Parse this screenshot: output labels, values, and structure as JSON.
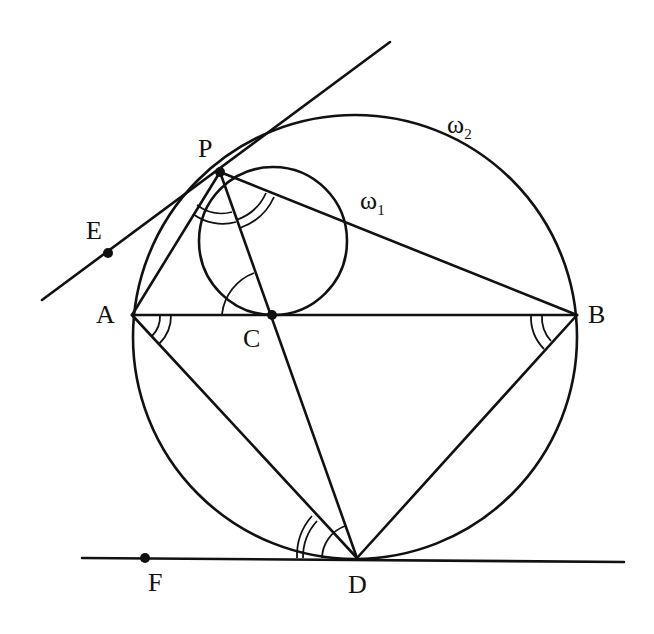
{
  "diagram": {
    "type": "geometry",
    "stroke_color": "#111111",
    "points": {
      "P": {
        "label": "P",
        "x": 220,
        "y": 172
      },
      "A": {
        "label": "A",
        "x": 132,
        "y": 315
      },
      "B": {
        "label": "B",
        "x": 577,
        "y": 315
      },
      "C": {
        "label": "C",
        "x": 272,
        "y": 315
      },
      "D": {
        "label": "D",
        "x": 357,
        "y": 558
      },
      "E": {
        "label": "E",
        "x": 108,
        "y": 253
      },
      "F": {
        "label": "F",
        "x": 145,
        "y": 558
      }
    },
    "circles": [
      {
        "name": "ω1",
        "label": "ω",
        "subscript": "1",
        "cx": 273,
        "cy": 241,
        "r": 74
      },
      {
        "name": "ω2",
        "label": "ω",
        "subscript": "2",
        "cx": 355,
        "cy": 337,
        "r": 222
      }
    ],
    "lines": [
      {
        "name": "tangent-PE",
        "from": [
          42,
          300
        ],
        "to": [
          390,
          42
        ]
      },
      {
        "name": "tangent-DF",
        "from": [
          82,
          558
        ],
        "to": [
          624,
          562
        ]
      }
    ],
    "segments": [
      "PA",
      "PB",
      "PC",
      "PD",
      "AB",
      "AD",
      "BD"
    ]
  }
}
